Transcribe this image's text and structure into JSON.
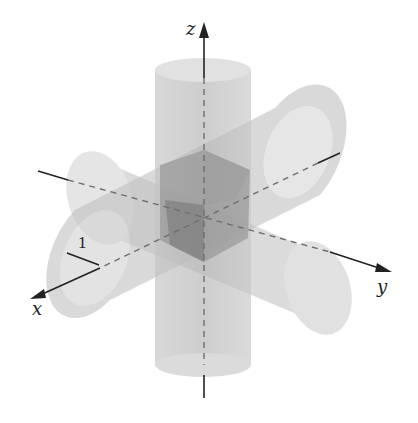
{
  "figure": {
    "axes": {
      "x_label": "x",
      "y_label": "y",
      "z_label": "z"
    },
    "radius_label": "1",
    "colors": {
      "background": "#ffffff",
      "cylinder_fill": "#bdbdbd",
      "cylinder_light": "#d9d9d9",
      "overlap_dark": "#7a7a7a",
      "axis": "#222222",
      "dashed_axis": "#6e6e6e"
    }
  }
}
